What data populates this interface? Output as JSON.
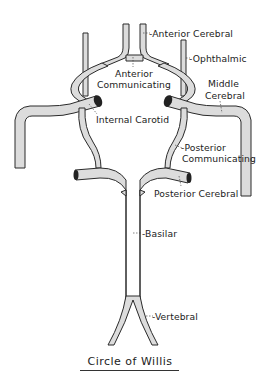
{
  "title": "Circle of Willis",
  "labels": {
    "anterior_cerebral": "-Anterior Cerebral",
    "ophthalmic": "-Ophthalmic",
    "anterior_communicating_1": "Anterior",
    "anterior_communicating_2": "Communicating",
    "middle_cerebral_1": "Middle",
    "middle_cerebral_2": "Cerebral",
    "internal_carotid": "Internal Carotid",
    "posterior_communicating_1": "-Posterior",
    "posterior_communicating_2": "Communicating",
    "posterior_cerebral": "Posterior Cerebral",
    "basilar": "-Basilar",
    "vertebral": "-Vertebral"
  },
  "colors": {
    "vessel_fill": "#dcdcdc",
    "outline": "#2a2a2a",
    "text": "#222222",
    "background": "#ffffff"
  }
}
